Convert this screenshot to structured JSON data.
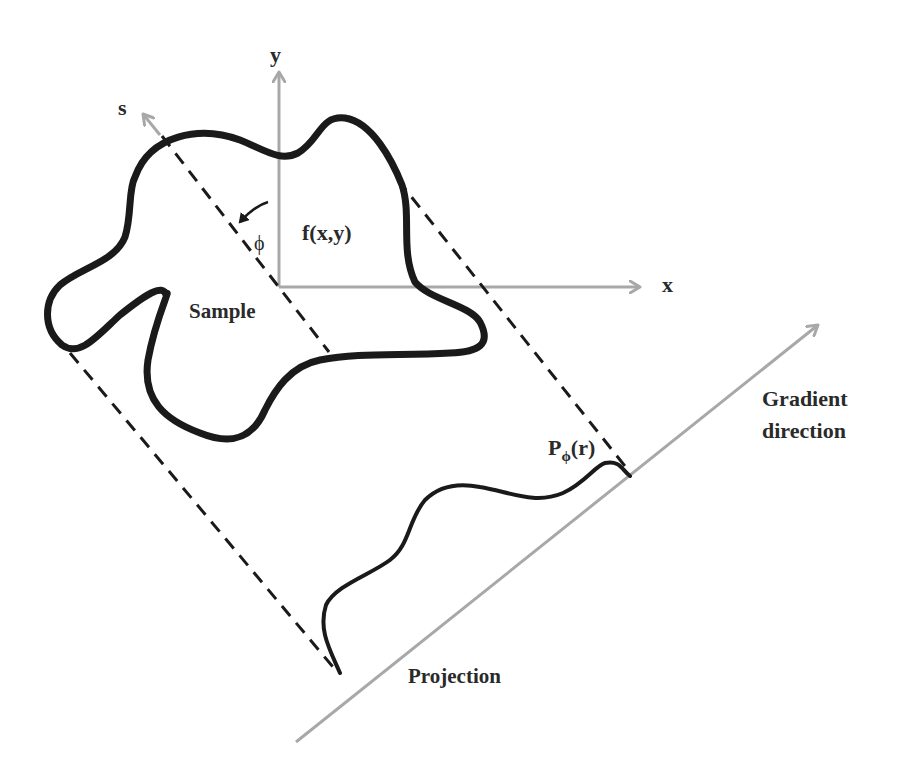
{
  "diagram": {
    "colors": {
      "axis": "#a8a8a8",
      "curve": "#1a1a1a",
      "dashed": "#1a1a1a",
      "text": "#2a2a2a"
    },
    "labels": {
      "y_axis": "y",
      "x_axis": "x",
      "s_axis": "s",
      "angle": "ϕ",
      "function": "f(x,y)",
      "sample": "Sample",
      "projection_main": "P",
      "projection_sub": "ϕ",
      "projection_arg": "(r)",
      "projection": "Projection",
      "gradient_line1": "Gradient",
      "gradient_line2": "direction"
    },
    "nodes": [
      {
        "id": "sample",
        "label": "Sample",
        "shape": "closed blob outline"
      },
      {
        "id": "function",
        "label": "f(x,y)"
      },
      {
        "id": "projection_profile",
        "label": "Pϕ(r)",
        "shape": "wavy curve on gradient line"
      },
      {
        "id": "gradient_axis",
        "label": "Gradient direction"
      }
    ],
    "edges": [
      {
        "from": "sample",
        "to": "projection_profile",
        "style": "dashed",
        "note": "left boundary projection line"
      },
      {
        "from": "sample",
        "to": "projection_profile",
        "style": "dashed",
        "note": "right boundary projection line"
      },
      {
        "from": "origin",
        "to": "sample",
        "style": "dashed",
        "note": "s-axis through origin"
      }
    ]
  }
}
